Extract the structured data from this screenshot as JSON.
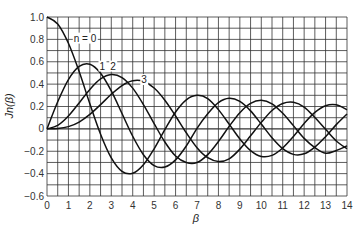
{
  "chart_data": {
    "type": "line",
    "title": "",
    "xlabel": "β",
    "ylabel": "Jn(β)",
    "xlim": [
      0,
      14
    ],
    "ylim": [
      -0.6,
      1.0
    ],
    "grid": true,
    "grid_x_step": 0.5,
    "grid_y_step": 0.1,
    "xticks": [
      0,
      1,
      2,
      3,
      4,
      5,
      6,
      7,
      8,
      9,
      10,
      11,
      12,
      13,
      14
    ],
    "yticks": [
      1.0,
      0.8,
      0.6,
      0.4,
      0.2,
      0,
      -0.2,
      -0.4,
      -0.6
    ],
    "ytick_labels": [
      "1.0",
      "0.8",
      "0.6",
      "0.4",
      "0.2",
      "0",
      "−0.2",
      "−0.4",
      "−0.6"
    ],
    "x": [
      0,
      0.5,
      1,
      1.5,
      2,
      2.5,
      3,
      3.5,
      4,
      4.5,
      5,
      5.5,
      6,
      6.5,
      7,
      7.5,
      8,
      8.5,
      9,
      9.5,
      10,
      10.5,
      11,
      11.5,
      12,
      12.5,
      13,
      13.5,
      14
    ],
    "series": [
      {
        "name": "n = 0",
        "label_text": "n = 0",
        "values": [
          1,
          0.938,
          0.765,
          0.512,
          0.224,
          -0.048,
          -0.26,
          -0.38,
          -0.397,
          -0.321,
          -0.178,
          -0.007,
          0.151,
          0.26,
          0.3,
          0.271,
          0.172,
          0.042,
          -0.09,
          -0.194,
          -0.246,
          -0.237,
          -0.171,
          -0.068,
          0.048,
          0.147,
          0.207,
          0.215,
          0.171
        ]
      },
      {
        "name": "1",
        "label_text": "1",
        "values": [
          0,
          0.242,
          0.44,
          0.558,
          0.577,
          0.497,
          0.339,
          0.137,
          -0.066,
          -0.231,
          -0.328,
          -0.341,
          -0.277,
          -0.153,
          0.005,
          0.135,
          0.235,
          0.273,
          0.245,
          0.161,
          0.043,
          -0.079,
          -0.177,
          -0.228,
          -0.223,
          -0.163,
          -0.07,
          0.038,
          0.133
        ]
      },
      {
        "name": "2",
        "label_text": "2",
        "values": [
          0,
          0.031,
          0.115,
          0.232,
          0.353,
          0.446,
          0.486,
          0.459,
          0.364,
          0.217,
          0.047,
          -0.117,
          -0.243,
          -0.301,
          -0.301,
          -0.23,
          -0.113,
          0.022,
          0.145,
          0.228,
          0.255,
          0.224,
          0.139,
          0.029,
          -0.085,
          -0.167,
          -0.218,
          -0.193,
          -0.152
        ]
      },
      {
        "name": "3",
        "label_text": "3",
        "values": [
          0,
          0.003,
          0.02,
          0.061,
          0.129,
          0.217,
          0.309,
          0.387,
          0.43,
          0.425,
          0.365,
          0.256,
          0.115,
          -0.035,
          -0.168,
          -0.258,
          -0.291,
          -0.268,
          -0.181,
          -0.062,
          0.058,
          0.164,
          0.227,
          0.238,
          0.195,
          0.101,
          -0.004,
          -0.108,
          -0.177
        ]
      }
    ],
    "annotations": [
      {
        "text": "n = 0",
        "x": 1.25,
        "y": 0.78
      },
      {
        "text": "1",
        "x": 2.45,
        "y": 0.53
      },
      {
        "text": "2",
        "x": 2.95,
        "y": 0.53
      },
      {
        "text": "3",
        "x": 4.4,
        "y": 0.41
      }
    ]
  }
}
